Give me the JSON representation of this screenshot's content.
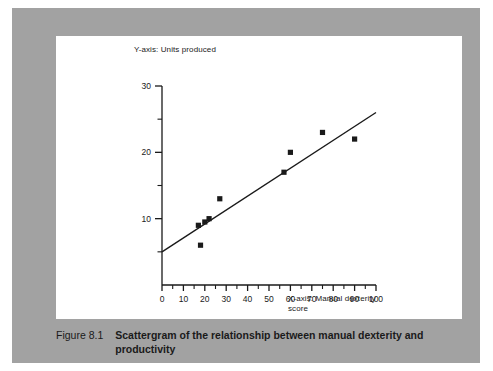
{
  "figure": {
    "caption_label": "Figure 8.1",
    "caption_text": "Scattergram of the relationship between manual dexterity and productivity",
    "frame_color": "#a2a2a2",
    "panel_color": "#ffffff",
    "ink_color": "#1a1a1a"
  },
  "chart_data": {
    "type": "scatter",
    "title": "",
    "xlabel": "X-axis: Manual dexterity score",
    "ylabel": "Y-axis: Units produced",
    "xlim": [
      0,
      100
    ],
    "ylim": [
      0,
      30
    ],
    "grid": false,
    "legend": "none",
    "x_major_ticks": [
      0,
      10,
      20,
      30,
      40,
      50,
      60,
      70,
      80,
      90,
      100
    ],
    "x_tick_labels": [
      "0",
      "10",
      "20",
      "30",
      "40",
      "50",
      "60",
      "70",
      "80",
      "90",
      "100"
    ],
    "x_minor_ticks": [
      5,
      15,
      25,
      35,
      45,
      55,
      65,
      75,
      85,
      95
    ],
    "y_major_ticks": [
      10,
      20,
      30
    ],
    "y_tick_labels": [
      "10",
      "20",
      "30"
    ],
    "y_minor_ticks": [
      5,
      15,
      25
    ],
    "marker": "square",
    "marker_color": "#1a1a1a",
    "points": [
      {
        "x": 17,
        "y": 9
      },
      {
        "x": 20,
        "y": 9.5
      },
      {
        "x": 18,
        "y": 6
      },
      {
        "x": 22,
        "y": 10
      },
      {
        "x": 27,
        "y": 13
      },
      {
        "x": 57,
        "y": 17
      },
      {
        "x": 60,
        "y": 20
      },
      {
        "x": 75,
        "y": 23
      },
      {
        "x": 90,
        "y": 22
      }
    ],
    "trendline": {
      "label": "line of best fit",
      "x1": 0,
      "y1": 5,
      "x2": 100,
      "y2": 26,
      "color": "#1a1a1a"
    }
  }
}
